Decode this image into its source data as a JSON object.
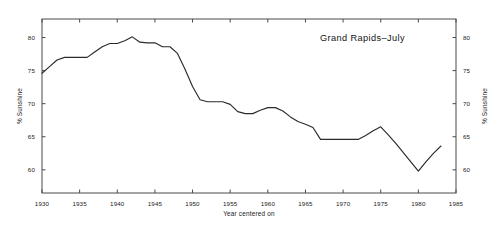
{
  "chart_data": {
    "type": "line",
    "title": "Grand Rapids–July",
    "xlabel": "Year centered on",
    "ylabel": "% Sunshine",
    "ylabel_right": "% Sunshine",
    "xlim": [
      1930,
      1985
    ],
    "ylim": [
      56.5,
      82.8
    ],
    "grid": false,
    "legend": null,
    "xticks": [
      1930,
      1935,
      1940,
      1945,
      1950,
      1955,
      1960,
      1965,
      1970,
      1975,
      1980,
      1985
    ],
    "xtick_labels": [
      "1930",
      "1935",
      "1940",
      "1945",
      "1950",
      "1955",
      "1960",
      "1965",
      "1970",
      "1975",
      "1980",
      "1985"
    ],
    "yticks": [
      60,
      65,
      70,
      75,
      80
    ],
    "ytick_labels": [
      "60",
      "65",
      "70",
      "75",
      "80"
    ],
    "ytick_labels_right": [
      "60",
      "65",
      "70",
      "75",
      "80"
    ],
    "series": [
      {
        "name": "% Sunshine",
        "x": [
          1930,
          1931,
          1932,
          1933,
          1934,
          1935,
          1936,
          1937,
          1938,
          1939,
          1940,
          1941,
          1942,
          1943,
          1944,
          1945,
          1946,
          1947,
          1948,
          1949,
          1950,
          1951,
          1952,
          1953,
          1954,
          1955,
          1956,
          1957,
          1958,
          1959,
          1960,
          1961,
          1962,
          1963,
          1964,
          1965,
          1966,
          1967,
          1968,
          1969,
          1970,
          1971,
          1972,
          1973,
          1974,
          1975,
          1976,
          1977,
          1978,
          1979,
          1980,
          1981,
          1982,
          1983
        ],
        "values": [
          74.6,
          75.6,
          76.6,
          77.0,
          77.0,
          77.0,
          77.0,
          77.8,
          78.6,
          79.1,
          79.1,
          79.5,
          80.1,
          79.3,
          79.2,
          79.2,
          78.6,
          78.6,
          77.6,
          75.2,
          72.6,
          70.6,
          70.3,
          70.3,
          70.3,
          69.9,
          68.8,
          68.5,
          68.5,
          69.0,
          69.4,
          69.4,
          68.9,
          68.0,
          67.3,
          66.9,
          66.4,
          64.6,
          64.6,
          64.6,
          64.6,
          64.6,
          64.6,
          65.2,
          65.9,
          66.5,
          65.3,
          64.0,
          62.6,
          61.2,
          59.8,
          61.2,
          62.5,
          63.6
        ]
      }
    ]
  },
  "axes": {
    "left_title": "% Sunshine",
    "right_title": "% Sunshine"
  }
}
